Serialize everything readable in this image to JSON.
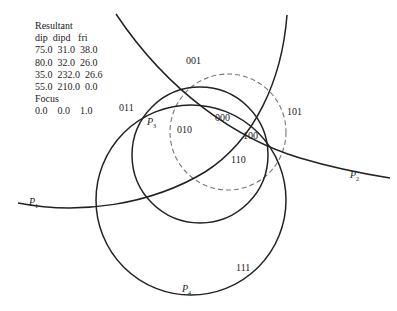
{
  "legend": {
    "title": "Resultant",
    "header": "dip  dipd   fri",
    "rows": [
      "75.0  31.0  38.0",
      "80.0  32.0  26.0",
      "35.0  232.0  26.6",
      "55.0  210.0  0.0"
    ],
    "focus_title": "Focus",
    "focus_row": "0.0    0.0    1.0"
  },
  "regions": {
    "r001": "001",
    "r011": "011",
    "r010": "010",
    "r000": "000",
    "r100": "100",
    "r101": "101",
    "r110": "110",
    "r111": "111"
  },
  "planes": {
    "p1": {
      "name": "P",
      "sub": "1"
    },
    "p2": {
      "name": "P",
      "sub": "2"
    },
    "p3": {
      "name": "P",
      "sub": "3"
    },
    "p4": {
      "name": "P",
      "sub": "4"
    }
  },
  "colors": {
    "line": "#222222",
    "dashed": "#777777"
  }
}
